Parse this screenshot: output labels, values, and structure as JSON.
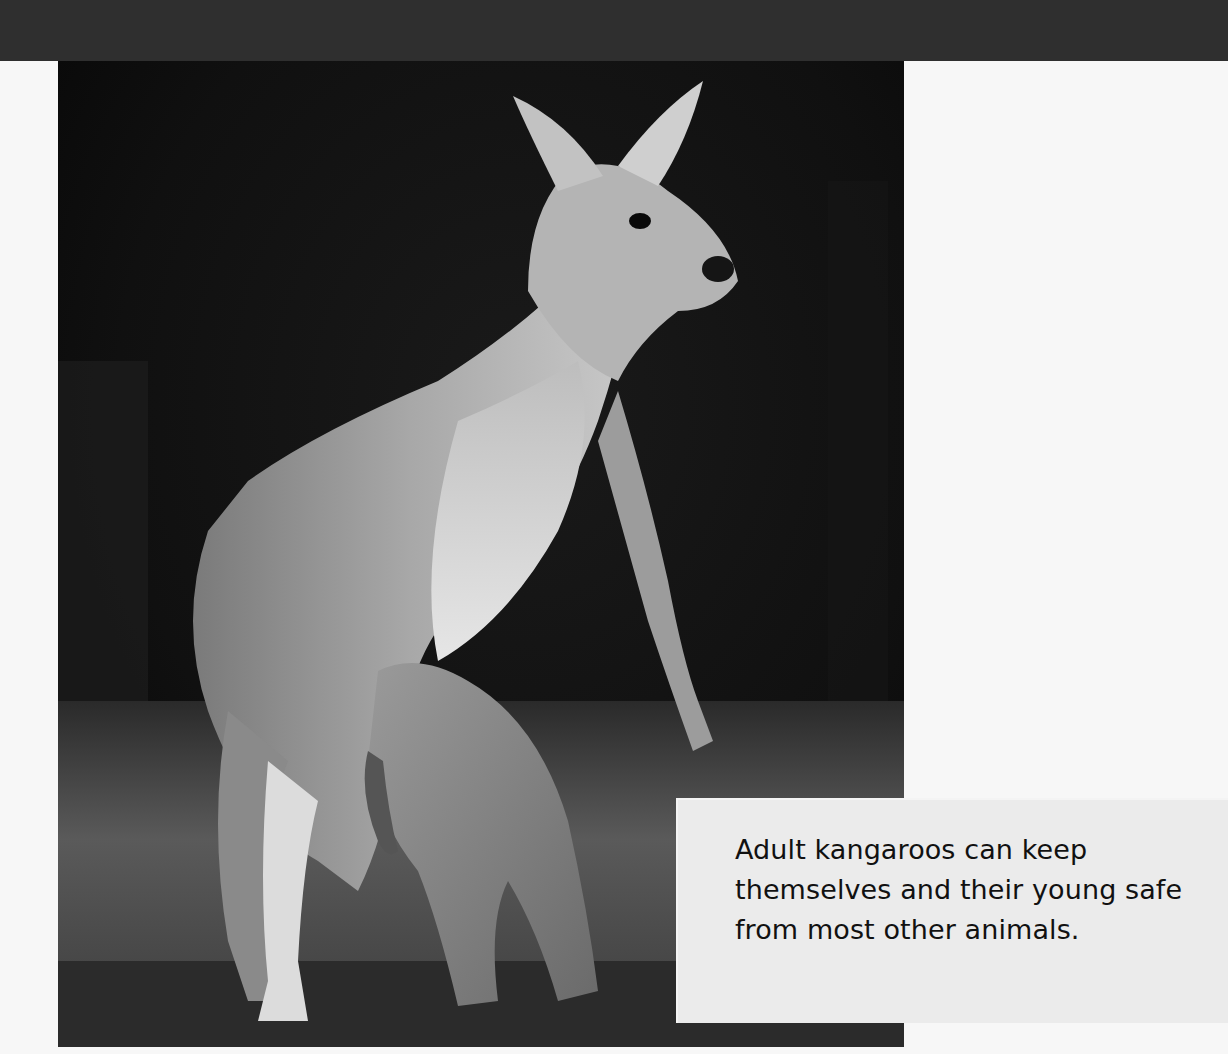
{
  "page": {
    "header_band_color": "#2f2f2f",
    "background_color": "#f7f7f7"
  },
  "photo": {
    "subject": "Adult kangaroo standing with joey at its pouch",
    "style": "black-and-white photograph"
  },
  "caption": {
    "text": "Adult kangaroos can keep themselves and their young safe from most other animals.",
    "box_color": "#ebebeb",
    "text_color": "#111111"
  }
}
